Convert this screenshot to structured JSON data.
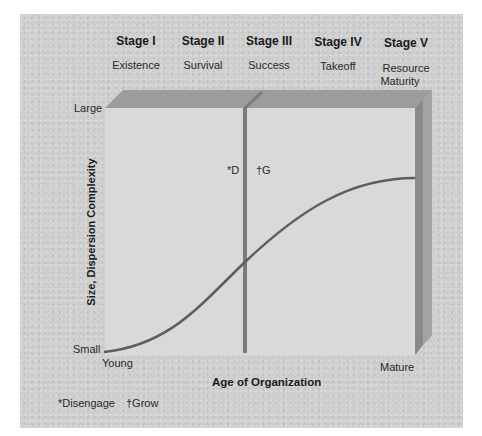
{
  "stages": [
    {
      "title": "Stage I",
      "name": "Existence"
    },
    {
      "title": "Stage II",
      "name": "Survival"
    },
    {
      "title": "Stage III",
      "name": "Success"
    },
    {
      "title": "Stage IV",
      "name": "Takeoff"
    },
    {
      "title": "Stage V",
      "name": "Resource",
      "name2": "Maturity"
    }
  ],
  "y_axis": {
    "label": "Size, Dispersion Complexity",
    "top": "Large",
    "bottom": "Small"
  },
  "x_axis": {
    "label": "Age of Organization",
    "left": "Young",
    "right": "Mature"
  },
  "markers": {
    "disengage": "*D",
    "grow": "†G"
  },
  "footnotes": {
    "disengage": "*Disengage",
    "grow": "†Grow"
  },
  "colors": {
    "panel": "#cdcdcd",
    "box_face": "#d9d9d9",
    "box_top": "#9a9a9a",
    "box_side": "#8a8a8a",
    "curve": "#5e5e5e",
    "divider": "#7a7a7a"
  }
}
